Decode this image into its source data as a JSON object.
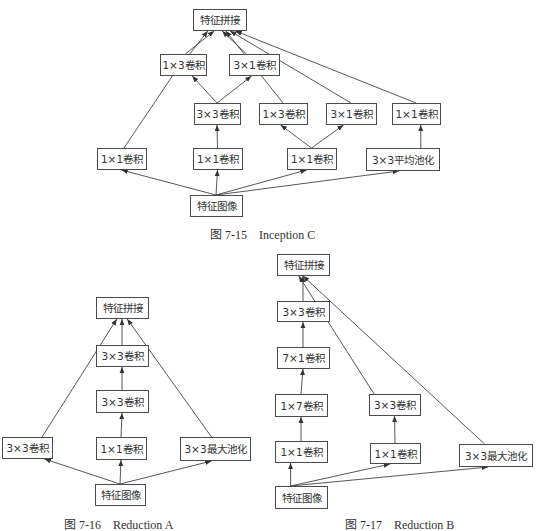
{
  "colors": {
    "background": "#ffffff",
    "box_border": "#4a4a4a",
    "line": "#444444",
    "text": "#333333"
  },
  "diagrams": [
    {
      "id": "inception-c",
      "caption": "图 7-15    Inception C",
      "nodes": [
        {
          "id": "concat",
          "label": "特征拼接"
        },
        {
          "id": "conv1x3_top",
          "label": "1×3卷积"
        },
        {
          "id": "conv3x1_top",
          "label": "3×1卷积"
        },
        {
          "id": "conv3x3",
          "label": "3×3卷积"
        },
        {
          "id": "conv1x3_r",
          "label": "1×3卷积"
        },
        {
          "id": "conv3x1_r",
          "label": "3×1卷积"
        },
        {
          "id": "conv1x1_pool",
          "label": "1×1卷积"
        },
        {
          "id": "conv1x1_left",
          "label": "1×1卷积"
        },
        {
          "id": "conv1x1_mid",
          "label": "1×1卷积"
        },
        {
          "id": "conv1x1_right",
          "label": "1×1卷积"
        },
        {
          "id": "avgpool",
          "label": "3×3平均池化"
        },
        {
          "id": "input",
          "label": "特征图像"
        }
      ],
      "edges": [
        {
          "from": "input",
          "to": "conv1x1_left"
        },
        {
          "from": "input",
          "to": "conv1x1_mid"
        },
        {
          "from": "input",
          "to": "conv1x1_right"
        },
        {
          "from": "input",
          "to": "avgpool"
        },
        {
          "from": "conv1x1_mid",
          "to": "conv3x3"
        },
        {
          "from": "conv3x3",
          "to": "conv1x3_top"
        },
        {
          "from": "conv3x3",
          "to": "conv3x1_top"
        },
        {
          "from": "conv1x1_right",
          "to": "conv1x3_r"
        },
        {
          "from": "conv1x1_right",
          "to": "conv3x1_r"
        },
        {
          "from": "avgpool",
          "to": "conv1x1_pool"
        },
        {
          "from": "conv1x1_left",
          "to": "concat"
        },
        {
          "from": "conv1x3_top",
          "to": "concat"
        },
        {
          "from": "conv3x1_top",
          "to": "concat"
        },
        {
          "from": "conv1x3_r",
          "to": "concat"
        },
        {
          "from": "conv3x1_r",
          "to": "concat"
        },
        {
          "from": "conv1x1_pool",
          "to": "concat"
        }
      ]
    },
    {
      "id": "reduction-a",
      "caption": "图 7-16    Reduction A",
      "nodes": [
        {
          "id": "concat",
          "label": "特征拼接"
        },
        {
          "id": "conv3x3_b",
          "label": "3×3卷积"
        },
        {
          "id": "conv3x3_a",
          "label": "3×3卷积"
        },
        {
          "id": "conv3x3_left",
          "label": "3×3卷积"
        },
        {
          "id": "conv1x1",
          "label": "1×1卷积"
        },
        {
          "id": "maxpool",
          "label": "3×3最大池化"
        },
        {
          "id": "input",
          "label": "特征图像"
        }
      ],
      "edges": [
        {
          "from": "input",
          "to": "conv3x3_left"
        },
        {
          "from": "input",
          "to": "conv1x1"
        },
        {
          "from": "input",
          "to": "maxpool"
        },
        {
          "from": "conv1x1",
          "to": "conv3x3_a"
        },
        {
          "from": "conv3x3_a",
          "to": "conv3x3_b"
        },
        {
          "from": "conv3x3_left",
          "to": "concat"
        },
        {
          "from": "conv3x3_b",
          "to": "concat"
        },
        {
          "from": "maxpool",
          "to": "concat"
        }
      ]
    },
    {
      "id": "reduction-b",
      "caption": "图 7-17    Reduction B",
      "nodes": [
        {
          "id": "concat",
          "label": "特征拼接"
        },
        {
          "id": "conv3x3_top",
          "label": "3×3卷积"
        },
        {
          "id": "conv7x1",
          "label": "7×1卷积"
        },
        {
          "id": "conv1x7",
          "label": "1×7卷积"
        },
        {
          "id": "conv3x3_mid",
          "label": "3×3卷积"
        },
        {
          "id": "conv1x1_left",
          "label": "1×1卷积"
        },
        {
          "id": "conv1x1_mid",
          "label": "1×1卷积"
        },
        {
          "id": "maxpool",
          "label": "3×3最大池化"
        },
        {
          "id": "input",
          "label": "特征图像"
        }
      ],
      "edges": [
        {
          "from": "input",
          "to": "conv1x1_left"
        },
        {
          "from": "input",
          "to": "conv1x1_mid"
        },
        {
          "from": "input",
          "to": "maxpool"
        },
        {
          "from": "conv1x1_left",
          "to": "conv1x7"
        },
        {
          "from": "conv1x7",
          "to": "conv7x1"
        },
        {
          "from": "conv7x1",
          "to": "conv3x3_top"
        },
        {
          "from": "conv3x3_top",
          "to": "concat"
        },
        {
          "from": "conv1x1_mid",
          "to": "conv3x3_mid"
        },
        {
          "from": "conv3x3_mid",
          "to": "concat"
        },
        {
          "from": "maxpool",
          "to": "concat"
        }
      ]
    }
  ]
}
